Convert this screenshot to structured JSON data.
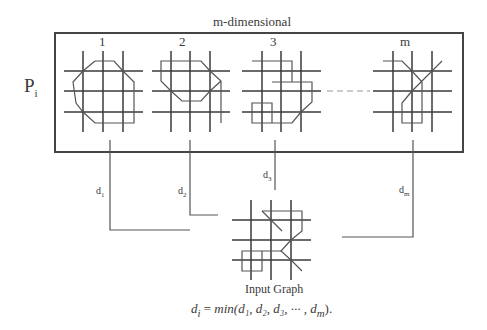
{
  "title": "m-dimensional",
  "row_label": {
    "main": "P",
    "sub": "i"
  },
  "panels": [
    {
      "label": "1"
    },
    {
      "label": "2"
    },
    {
      "label": "3"
    },
    {
      "label": "m"
    }
  ],
  "distances": [
    {
      "main": "d",
      "sub": "1"
    },
    {
      "main": "d",
      "sub": "2"
    },
    {
      "main": "d",
      "sub": "3"
    },
    {
      "main": "d",
      "sub": "m"
    }
  ],
  "input_graph_label": "Input Graph",
  "formula": {
    "lhs": "d",
    "lhs_sub": "i",
    "equals": " = ",
    "fn": "min",
    "args": "(d₁, d₂, d₃, ··· , d",
    "last_sub": "m",
    "close": ")."
  },
  "colors": {
    "grid": "#3a3a3a",
    "path": "#555555",
    "box": "#444444",
    "dash": "#999999"
  }
}
